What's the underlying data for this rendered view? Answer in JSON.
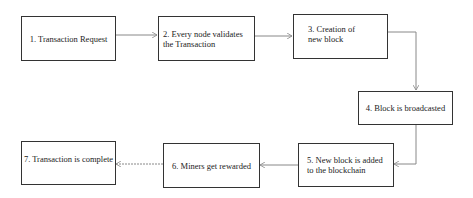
{
  "diagram": {
    "type": "flowchart",
    "steps": [
      {
        "id": 1,
        "label": "1. Transaction Request"
      },
      {
        "id": 2,
        "label": "2. Every node validates the Transaction"
      },
      {
        "id": 3,
        "label": "3. Creation of new block"
      },
      {
        "id": 4,
        "label": "4. Block is broadcasted"
      },
      {
        "id": 5,
        "label": "5. New block is added to the blockchain"
      },
      {
        "id": 6,
        "label": "6. Miners get rewarded"
      },
      {
        "id": 7,
        "label": "7. Transaction is complete"
      }
    ],
    "edges": [
      {
        "from": 1,
        "to": 2
      },
      {
        "from": 2,
        "to": 3
      },
      {
        "from": 3,
        "to": 4
      },
      {
        "from": 4,
        "to": 5
      },
      {
        "from": 5,
        "to": 6
      },
      {
        "from": 6,
        "to": 7
      }
    ],
    "colors": {
      "border": "#333333",
      "arrow": "#888888",
      "background": "#ffffff"
    }
  }
}
